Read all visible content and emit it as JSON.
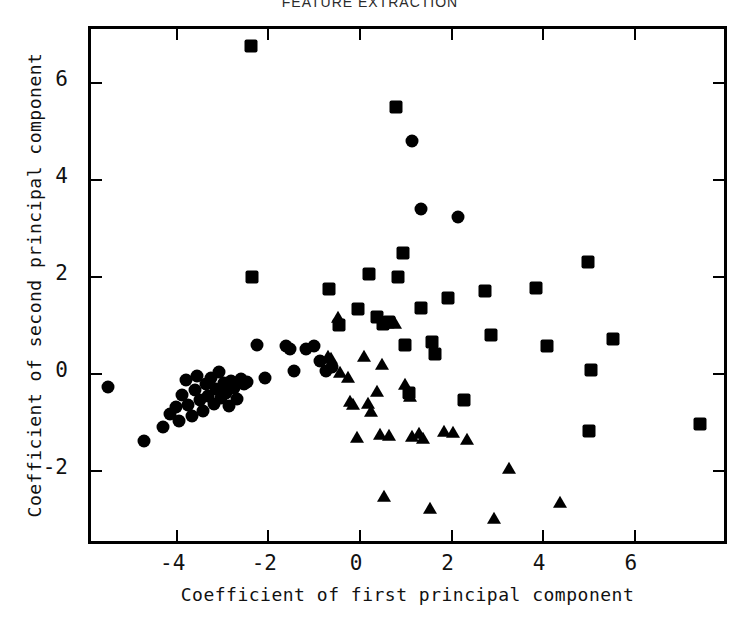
{
  "chart_data": {
    "type": "scatter",
    "title": "FEATURE EXTRACTION",
    "xlabel": "Coefficient of first principal component",
    "ylabel": "Coefficient of second principal component",
    "xlim": [
      -5.85,
      8.1
    ],
    "ylim": [
      -3.6,
      7.1
    ],
    "xticks": [
      -4,
      -2,
      0,
      2,
      4,
      6
    ],
    "yticks": [
      -2,
      0,
      2,
      4,
      6
    ],
    "xticklabels": [
      "-4",
      "-2",
      "0",
      "2",
      "4",
      "6"
    ],
    "yticklabels": [
      "-2",
      "0",
      "2",
      "4",
      "6"
    ],
    "grid": false,
    "legend": "none",
    "marker_color": "#000000",
    "frame_color": "#000000",
    "background": "#ffffff",
    "series": [
      {
        "name": "class-circle",
        "marker": "circle",
        "points": [
          [
            -5.42,
            -0.35
          ],
          [
            -4.62,
            -1.48
          ],
          [
            -4.22,
            -1.18
          ],
          [
            -4.05,
            -0.92
          ],
          [
            -3.93,
            -0.78
          ],
          [
            -3.86,
            -1.05
          ],
          [
            -3.8,
            -0.52
          ],
          [
            -3.72,
            -0.22
          ],
          [
            -3.66,
            -0.72
          ],
          [
            -3.58,
            -0.95
          ],
          [
            -3.52,
            -0.42
          ],
          [
            -3.46,
            -0.12
          ],
          [
            -3.4,
            -0.62
          ],
          [
            -3.33,
            -0.86
          ],
          [
            -3.27,
            -0.3
          ],
          [
            -3.22,
            -0.55
          ],
          [
            -3.16,
            -0.18
          ],
          [
            -3.1,
            -0.7
          ],
          [
            -3.05,
            -0.4
          ],
          [
            -2.99,
            -0.05
          ],
          [
            -2.94,
            -0.58
          ],
          [
            -2.88,
            -0.28
          ],
          [
            -2.83,
            -0.48
          ],
          [
            -2.78,
            -0.75
          ],
          [
            -2.72,
            -0.24
          ],
          [
            -2.66,
            -0.38
          ],
          [
            -2.6,
            -0.6
          ],
          [
            -2.52,
            -0.2
          ],
          [
            -2.45,
            -0.3
          ],
          [
            -2.38,
            -0.26
          ],
          [
            -2.16,
            0.52
          ],
          [
            -1.98,
            -0.18
          ],
          [
            -1.52,
            0.5
          ],
          [
            -1.44,
            0.42
          ],
          [
            -1.36,
            -0.02
          ],
          [
            -1.1,
            0.42
          ],
          [
            -0.92,
            0.5
          ],
          [
            -0.78,
            0.18
          ],
          [
            -0.66,
            -0.02
          ],
          [
            -0.52,
            0.06
          ],
          [
            1.22,
            4.72
          ],
          [
            1.42,
            3.32
          ],
          [
            2.22,
            3.16
          ]
        ]
      },
      {
        "name": "class-square",
        "marker": "square",
        "points": [
          [
            -2.3,
            6.68
          ],
          [
            -2.28,
            1.92
          ],
          [
            -0.58,
            1.66
          ],
          [
            -0.36,
            0.92
          ],
          [
            0.04,
            1.26
          ],
          [
            0.28,
            1.98
          ],
          [
            0.46,
            1.08
          ],
          [
            0.6,
            0.94
          ],
          [
            0.72,
            0.98
          ],
          [
            0.88,
            5.42
          ],
          [
            0.92,
            1.92
          ],
          [
            1.02,
            2.42
          ],
          [
            1.06,
            0.52
          ],
          [
            1.16,
            -0.48
          ],
          [
            1.42,
            1.28
          ],
          [
            1.66,
            0.58
          ],
          [
            1.72,
            0.32
          ],
          [
            2.02,
            1.48
          ],
          [
            2.36,
            -0.62
          ],
          [
            2.82,
            1.62
          ],
          [
            2.94,
            0.72
          ],
          [
            3.92,
            1.68
          ],
          [
            4.18,
            0.48
          ],
          [
            5.06,
            2.22
          ],
          [
            5.08,
            -1.26
          ],
          [
            5.14,
            0.0
          ],
          [
            5.62,
            0.64
          ],
          [
            7.52,
            -1.12
          ]
        ]
      },
      {
        "name": "class-triangle",
        "marker": "triangle",
        "points": [
          [
            -0.62,
            0.26
          ],
          [
            -0.54,
            0.22
          ],
          [
            -0.4,
            1.06
          ],
          [
            -0.34,
            -0.06
          ],
          [
            -0.18,
            -0.18
          ],
          [
            -0.12,
            -0.66
          ],
          [
            -0.06,
            -0.72
          ],
          [
            0.02,
            -1.42
          ],
          [
            0.18,
            0.26
          ],
          [
            0.26,
            -0.7
          ],
          [
            0.32,
            -0.88
          ],
          [
            0.46,
            -0.46
          ],
          [
            0.52,
            -1.34
          ],
          [
            0.56,
            0.1
          ],
          [
            0.62,
            -2.62
          ],
          [
            0.72,
            -1.36
          ],
          [
            0.86,
            0.94
          ],
          [
            1.06,
            -0.32
          ],
          [
            1.18,
            -0.56
          ],
          [
            1.22,
            -1.4
          ],
          [
            1.38,
            -1.32
          ],
          [
            1.46,
            -1.44
          ],
          [
            1.62,
            -2.88
          ],
          [
            1.92,
            -1.28
          ],
          [
            2.12,
            -1.3
          ],
          [
            2.42,
            -1.46
          ],
          [
            3.02,
            -3.08
          ],
          [
            3.34,
            -2.06
          ],
          [
            4.46,
            -2.76
          ]
        ]
      }
    ]
  }
}
